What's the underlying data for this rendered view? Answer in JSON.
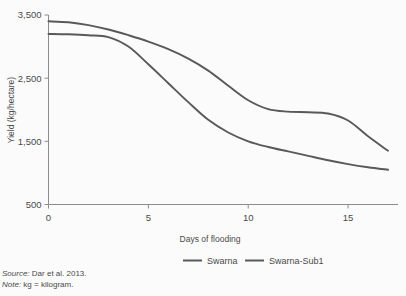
{
  "chart_data": {
    "type": "line",
    "title": "",
    "xlabel": "Days of flooding",
    "ylabel": "Yield (kg/hectare)",
    "xlim": [
      0,
      17.5
    ],
    "ylim": [
      500,
      3500
    ],
    "xticks": [
      0,
      5,
      10,
      15
    ],
    "xtick_labels": [
      "0",
      "5",
      "10",
      "15"
    ],
    "yticks": [
      500,
      1500,
      2500,
      3500
    ],
    "ytick_labels": [
      "500",
      "1,500",
      "2,500",
      "3,500"
    ],
    "grid": false,
    "legend_position": "bottom",
    "x": [
      0,
      1,
      2,
      3,
      4,
      5,
      6,
      7,
      8,
      9,
      10,
      11,
      12,
      13,
      14,
      15,
      16,
      17
    ],
    "series": [
      {
        "name": "Swarna",
        "color": "#595959",
        "values": [
          3200,
          3195,
          3180,
          3150,
          3000,
          2720,
          2420,
          2120,
          1840,
          1640,
          1500,
          1410,
          1340,
          1270,
          1200,
          1140,
          1090,
          1050
        ]
      },
      {
        "name": "Swarna-Sub1",
        "color": "#595959",
        "values": [
          3400,
          3385,
          3340,
          3270,
          3180,
          3080,
          2960,
          2810,
          2620,
          2380,
          2150,
          2010,
          1970,
          1960,
          1940,
          1830,
          1580,
          1350
        ]
      }
    ]
  },
  "legend": {
    "items": [
      {
        "label": "Swarna"
      },
      {
        "label": "Swarna-Sub1"
      }
    ]
  },
  "notes": {
    "source_label": "Source:",
    "source_text": "Dar et al. 2013.",
    "note_label": "Note:",
    "note_text": "kg = kilogram."
  },
  "colors": {
    "line": "#595959",
    "axis": "#8c8c8c",
    "background": "#fbfbfb",
    "text": "#4a4a4a"
  }
}
